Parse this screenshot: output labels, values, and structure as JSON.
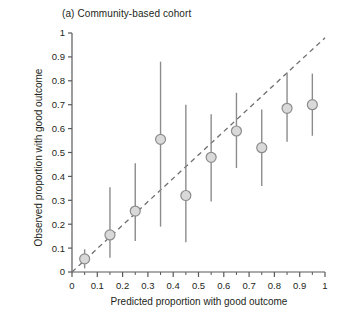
{
  "figure": {
    "title": "(a) Community-based cohort",
    "xlabel": "Predicted proportion with good outcome",
    "ylabel": "Observed proportion with good outcome"
  },
  "style": {
    "marker_fill": "#d9d9d9",
    "marker_stroke": "#8c8c8c",
    "errorbar_color": "#8c8c8c",
    "axis_color": "#58595b",
    "reference_line_color": "#6d6e71",
    "text_color": "#231f20",
    "background": "#ffffff"
  },
  "chart_data": {
    "type": "scatter",
    "title": "(a) Community-based cohort",
    "xlabel": "Predicted proportion with good outcome",
    "ylabel": "Observed proportion with good outcome",
    "xlim": [
      0,
      1
    ],
    "ylim": [
      0,
      1
    ],
    "xticks": [
      0,
      0.1,
      0.2,
      0.3,
      0.4,
      0.5,
      0.6,
      0.7,
      0.8,
      0.9,
      1
    ],
    "yticks": [
      0,
      0.1,
      0.2,
      0.3,
      0.4,
      0.5,
      0.6,
      0.7,
      0.8,
      0.9,
      1
    ],
    "xtick_labels": [
      "0",
      "0.1",
      "0.2",
      "0.3",
      "0.4",
      "0.5",
      "0.6",
      "0.7",
      "0.8",
      "0.9",
      "1"
    ],
    "ytick_labels": [
      "0",
      "0.1",
      "0.2",
      "0.3",
      "0.4",
      "0.5",
      "0.6",
      "0.7",
      "0.8",
      "0.9",
      "1"
    ],
    "minor_xtick_interval": 0.05,
    "grid": false,
    "legend": null,
    "reference_line": {
      "label": "identity / perfect calibration",
      "style": "dashed",
      "from": [
        0,
        0
      ],
      "to": [
        1.0,
        0.98
      ]
    },
    "x": [
      0.05,
      0.15,
      0.25,
      0.35,
      0.45,
      0.55,
      0.65,
      0.75,
      0.85,
      0.95
    ],
    "y": [
      0.055,
      0.155,
      0.255,
      0.555,
      0.32,
      0.48,
      0.59,
      0.52,
      0.685,
      0.7
    ],
    "y_lower": [
      0.015,
      0.06,
      0.13,
      0.19,
      0.125,
      0.295,
      0.435,
      0.36,
      0.545,
      0.57
    ],
    "y_upper": [
      0.095,
      0.355,
      0.455,
      0.88,
      0.7,
      0.66,
      0.75,
      0.68,
      0.835,
      0.83
    ],
    "errorbar_description": "95% confidence interval"
  }
}
